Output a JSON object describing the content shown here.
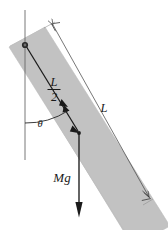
{
  "figure": {
    "type": "physics-free-body-diagram",
    "canvas": {
      "width": 168,
      "height": 230
    },
    "colors": {
      "rod_fill": "#c0c0c0",
      "rod_stroke": "#b0b0b0",
      "line": "#1a1a1a",
      "thin_line": "#555555",
      "background": "#ffffff"
    },
    "labels": {
      "half_length_numerator": "L",
      "half_length_denominator": "2",
      "angle": "θ",
      "weight": "Mg",
      "full_length": "L"
    },
    "elements": {
      "rod": {
        "name": "uniform rod",
        "shape": "rotated rectangle",
        "fill": "#c0c0c0",
        "angle_from_vertical_deg": 38
      },
      "pivot": {
        "name": "pivot point",
        "x": 25,
        "y": 45,
        "radius": 2.6
      },
      "vertical_reference_line": {
        "name": "vertical dashed reference",
        "x": 25,
        "y_top": 10,
        "y_bottom": 160
      },
      "half_length_arrow": {
        "name": "L/2 arrow from pivot to center of mass",
        "from": [
          25,
          45
        ],
        "to": [
          79,
          133
        ]
      },
      "weight_arrow": {
        "name": "Mg weight vector pointing down",
        "from": [
          79,
          133
        ],
        "to": [
          79,
          216
        ]
      },
      "angle_arc": {
        "name": "theta angle arc between vertical and rod",
        "center": [
          25,
          45
        ],
        "radius": 78
      },
      "length_dimension_line": {
        "name": "L dimension line with arrowheads at both ends",
        "from": [
          52,
          24
        ],
        "to": [
          150,
          198
        ]
      }
    },
    "label_positions": {
      "half_length": {
        "x": 54,
        "y": 88
      },
      "angle": {
        "x": 40,
        "y": 124
      },
      "weight": {
        "x": 62,
        "y": 180
      },
      "full_length": {
        "x": 104,
        "y": 110
      }
    }
  }
}
